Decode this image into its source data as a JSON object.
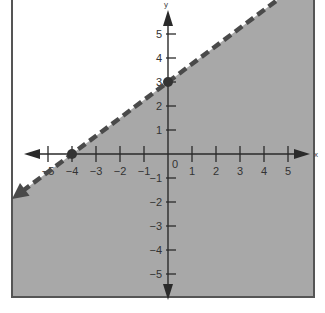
{
  "chart_data": {
    "type": "line",
    "title": "",
    "subtitle": "",
    "xlabel": "x",
    "ylabel": "y",
    "xlim": [
      -6,
      6
    ],
    "ylim": [
      -6,
      6
    ],
    "grid": false,
    "legend": null,
    "x_ticks": [
      -5,
      -4,
      -3,
      -2,
      -1,
      1,
      2,
      3,
      4,
      5
    ],
    "y_ticks": [
      -5,
      -4,
      -3,
      -2,
      -1,
      1,
      2,
      3,
      4,
      5
    ],
    "x_tick_labels": [
      "−5",
      "−4",
      "−3",
      "−2",
      "−1",
      "1",
      "2",
      "3",
      "4",
      "5"
    ],
    "y_tick_labels": [
      "−5",
      "−4",
      "−3",
      "−2",
      "−1",
      "1",
      "2",
      "3",
      "4",
      "5"
    ],
    "origin_label": "0",
    "series": [
      {
        "name": "boundary line y = (3/4)x + 3",
        "style": "dashed",
        "arrows": "both",
        "slope": 0.75,
        "intercept": 3,
        "x": [
          -6.5,
          5.5
        ],
        "y": [
          -1.875,
          7.125
        ]
      }
    ],
    "points": [
      {
        "x": -4,
        "y": 0,
        "label": "x-intercept"
      },
      {
        "x": 0,
        "y": 3,
        "label": "y-intercept"
      }
    ],
    "shaded_region": {
      "description": "half-plane below the dashed line",
      "inequality": "y < (3/4)x + 3"
    },
    "colors": {
      "shading": "#a8a8a8",
      "line": "#4a4a4a",
      "axes": "#2a2a2a",
      "frame": "#555555",
      "background": "#ffffff"
    }
  }
}
